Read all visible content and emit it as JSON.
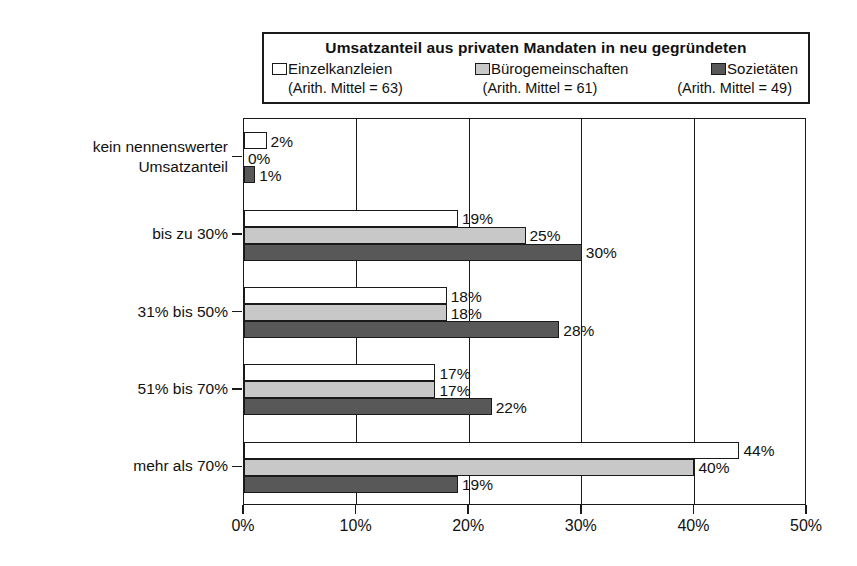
{
  "legend": {
    "title": "Umsatzanteil aus privaten Mandaten in neu gegründeten",
    "series": [
      {
        "name": "Einzelkanzleien",
        "mean_label": "(Arith. Mittel = 63)",
        "color": "#ffffff"
      },
      {
        "name": "Bürogemeinschaften",
        "mean_label": "(Arith. Mittel = 61)",
        "color": "#c8c8c8"
      },
      {
        "name": "Sozietäten",
        "mean_label": "(Arith. Mittel = 49)",
        "color": "#585858"
      }
    ]
  },
  "axis": {
    "x_ticks": [
      "0%",
      "10%",
      "20%",
      "30%",
      "40%",
      "50%"
    ]
  },
  "categories": [
    {
      "line1": "kein nennenswerter",
      "line2": "Umsatzanteil"
    },
    {
      "line1": "bis zu 30%",
      "line2": ""
    },
    {
      "line1": "31% bis 50%",
      "line2": ""
    },
    {
      "line1": "51% bis 70%",
      "line2": ""
    },
    {
      "line1": "mehr als 70%",
      "line2": ""
    }
  ],
  "bar_labels": [
    [
      "2%",
      "0%",
      "1%"
    ],
    [
      "19%",
      "25%",
      "30%"
    ],
    [
      "18%",
      "18%",
      "28%"
    ],
    [
      "17%",
      "17%",
      "22%"
    ],
    [
      "44%",
      "40%",
      "19%"
    ]
  ],
  "chart_data": {
    "type": "bar",
    "orientation": "horizontal",
    "title": "Umsatzanteil aus privaten Mandaten in neu gegründeten",
    "xlabel": "",
    "ylabel": "",
    "xlim": [
      0,
      50
    ],
    "xticks": [
      0,
      10,
      20,
      30,
      40,
      50
    ],
    "xtick_labels": [
      "0%",
      "10%",
      "20%",
      "30%",
      "40%",
      "50%"
    ],
    "grid": true,
    "legend_position": "top",
    "categories": [
      "kein nennenswerter Umsatzanteil",
      "bis zu 30%",
      "31% bis 50%",
      "51% bis 70%",
      "mehr als 70%"
    ],
    "series": [
      {
        "name": "Einzelkanzleien",
        "values": [
          2,
          19,
          18,
          17,
          44
        ],
        "mean": 63,
        "color": "#ffffff"
      },
      {
        "name": "Bürogemeinschaften",
        "values": [
          0,
          25,
          18,
          17,
          40
        ],
        "mean": 61,
        "color": "#c8c8c8"
      },
      {
        "name": "Sozietäten",
        "values": [
          1,
          30,
          28,
          22,
          19
        ],
        "mean": 49,
        "color": "#585858"
      }
    ],
    "units": "percent"
  }
}
